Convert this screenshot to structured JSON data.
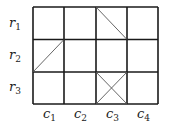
{
  "grid": {
    "rows": 3,
    "cols": 4,
    "x0": 33,
    "y0": 7,
    "cell_w": 31.25,
    "cell_h": 32.3,
    "line_color": "#1a1a1a",
    "diag_color": "#555555"
  },
  "row_labels": [
    {
      "base": "r",
      "sub": "1"
    },
    {
      "base": "r",
      "sub": "2"
    },
    {
      "base": "r",
      "sub": "3"
    }
  ],
  "col_labels": [
    {
      "base": "c",
      "sub": "1"
    },
    {
      "base": "c",
      "sub": "2"
    },
    {
      "base": "c",
      "sub": "3"
    },
    {
      "base": "c",
      "sub": "4"
    }
  ],
  "diagonals": [
    {
      "cell": "r1c3",
      "direction": "top-left to bottom-right"
    },
    {
      "cell": "r2c1",
      "direction": "bottom-left to top-right"
    },
    {
      "cell": "r3c3",
      "direction": "both (X)"
    }
  ]
}
